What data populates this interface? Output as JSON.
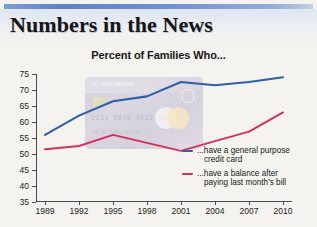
{
  "headline": "Numbers in the News",
  "chart_data": {
    "type": "line",
    "title": "Percent of Families Who...",
    "xlabel": "",
    "ylabel": "",
    "categories": [
      "1989",
      "1992",
      "1995",
      "1998",
      "2001",
      "2004",
      "2007",
      "2010"
    ],
    "x": [
      1989,
      1992,
      1995,
      1998,
      2001,
      2004,
      2007,
      2010
    ],
    "ylim": [
      35,
      75
    ],
    "yticks": [
      "35",
      "40",
      "45",
      "50",
      "55",
      "60",
      "65",
      "70",
      "75"
    ],
    "ytick_values": [
      35,
      40,
      45,
      50,
      55,
      60,
      65,
      70,
      75
    ],
    "grid": false,
    "legend_position": "inside-right",
    "series": [
      {
        "name": "...have a general purpose credit card",
        "name_line1": "...have a general purpose",
        "name_line2": "credit card",
        "color": "#2f5fa8",
        "values": [
          56,
          62,
          66.5,
          68,
          72.5,
          71.5,
          72.5,
          74
        ]
      },
      {
        "name": "...have a balance after paying last month's bill",
        "name_line1": "...have a balance after",
        "name_line2": "paying last month's bill",
        "color": "#d4305e",
        "values": [
          51.5,
          52.5,
          56,
          53.5,
          51,
          54,
          57,
          63
        ]
      }
    ]
  },
  "watermark_card": {
    "bank_name": "PLASTIBANK",
    "card_number": "1234 5678 9012 0000",
    "holder": "VALID THRU 00/00"
  },
  "colors": {
    "accent_rule": "#5d83c6",
    "series_blue": "#2f5fa8",
    "series_pink": "#d4305e",
    "page_background": "#f5f3ef"
  }
}
